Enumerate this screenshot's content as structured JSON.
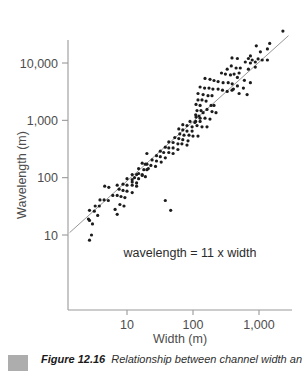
{
  "figure": {
    "caption_label": "Figure 12.16",
    "caption_text": "Relationship between channel width an",
    "bullet_color": "#adadad"
  },
  "colors": {
    "point": "#1c1c1c",
    "trend_line": "#8a8a8a",
    "axis": "#999999",
    "tick_text": "#4d4d4d",
    "annotation_text": "#2b2b2b"
  },
  "chart_data": {
    "type": "scatter",
    "title": "",
    "xlabel": "Width (m)",
    "ylabel": "Wavelength (m)",
    "x_scale": "log",
    "y_scale": "log",
    "xlim": [
      1.3,
      3300
    ],
    "ylim": [
      0.5,
      40000
    ],
    "grid": false,
    "legend": "none",
    "x_ticks": [
      {
        "value": 10,
        "label": "10"
      },
      {
        "value": 100,
        "label": "100"
      },
      {
        "value": 1000,
        "label": "1,000"
      }
    ],
    "y_ticks": [
      {
        "value": 10,
        "label": "10"
      },
      {
        "value": 100,
        "label": "100"
      },
      {
        "value": 1000,
        "label": "1,000"
      },
      {
        "value": 10000,
        "label": "10,000"
      }
    ],
    "annotation": "wavelength = 11 x width",
    "trendline": {
      "equation": "wavelength = 11 x width",
      "x1": 1.35,
      "y1": 11,
      "x2": 2800,
      "y2": 30000
    },
    "points": [
      [
        2300,
        36000
      ],
      [
        1450,
        22000
      ],
      [
        910,
        20000
      ],
      [
        1340,
        17600
      ],
      [
        1050,
        15700
      ],
      [
        740,
        13300
      ],
      [
        390,
        12300
      ],
      [
        470,
        12000
      ],
      [
        690,
        12000
      ],
      [
        790,
        11300
      ],
      [
        970,
        11800
      ],
      [
        1120,
        11300
      ],
      [
        1340,
        11300
      ],
      [
        620,
        10400
      ],
      [
        740,
        10000
      ],
      [
        880,
        10400
      ],
      [
        380,
        8900
      ],
      [
        450,
        8200
      ],
      [
        520,
        8200
      ],
      [
        880,
        8500
      ],
      [
        330,
        7800
      ],
      [
        270,
        6700
      ],
      [
        310,
        6400
      ],
      [
        370,
        6200
      ],
      [
        420,
        6400
      ],
      [
        690,
        7800
      ],
      [
        500,
        6700
      ],
      [
        600,
        5000
      ],
      [
        740,
        4540
      ],
      [
        470,
        5600
      ],
      [
        152,
        5400
      ],
      [
        181,
        5200
      ],
      [
        208,
        4950
      ],
      [
        240,
        4740
      ],
      [
        286,
        4540
      ],
      [
        342,
        4540
      ],
      [
        393,
        4340
      ],
      [
        128,
        3810
      ],
      [
        150,
        3650
      ],
      [
        175,
        3650
      ],
      [
        200,
        3500
      ],
      [
        240,
        3500
      ],
      [
        280,
        3350
      ],
      [
        330,
        3200
      ],
      [
        390,
        3350
      ],
      [
        119,
        2940
      ],
      [
        142,
        2810
      ],
      [
        169,
        2690
      ],
      [
        194,
        2690
      ],
      [
        119,
        2270
      ],
      [
        137,
        2270
      ],
      [
        158,
        2170
      ],
      [
        111,
        1900
      ],
      [
        128,
        1820
      ],
      [
        115,
        1480
      ],
      [
        132,
        1480
      ],
      [
        110,
        1250
      ],
      [
        123,
        1190
      ],
      [
        110,
        960
      ],
      [
        128,
        960
      ],
      [
        470,
        3980
      ],
      [
        580,
        3650
      ],
      [
        410,
        3500
      ],
      [
        500,
        2940
      ],
      [
        660,
        2810
      ],
      [
        188,
        1820
      ],
      [
        208,
        1820
      ],
      [
        163,
        1550
      ],
      [
        142,
        1360
      ],
      [
        194,
        1420
      ],
      [
        223,
        1360
      ],
      [
        111,
        1140
      ],
      [
        128,
        1090
      ],
      [
        152,
        1090
      ],
      [
        181,
        1050
      ],
      [
        90,
        960
      ],
      [
        107,
        920
      ],
      [
        70,
        840
      ],
      [
        81,
        810
      ],
      [
        97,
        770
      ],
      [
        115,
        810
      ],
      [
        137,
        770
      ],
      [
        163,
        770
      ],
      [
        61,
        710
      ],
      [
        70,
        680
      ],
      [
        81,
        650
      ],
      [
        97,
        650
      ],
      [
        63,
        580
      ],
      [
        73,
        550
      ],
      [
        87,
        550
      ],
      [
        100,
        530
      ],
      [
        119,
        530
      ],
      [
        53,
        500
      ],
      [
        61,
        480
      ],
      [
        70,
        460
      ],
      [
        84,
        440
      ],
      [
        43,
        420
      ],
      [
        50,
        410
      ],
      [
        59,
        390
      ],
      [
        68,
        390
      ],
      [
        81,
        370
      ],
      [
        38,
        340
      ],
      [
        43,
        330
      ],
      [
        50,
        330
      ],
      [
        59,
        310
      ],
      [
        32,
        290
      ],
      [
        36,
        275
      ],
      [
        43,
        275
      ],
      [
        50,
        264
      ],
      [
        28,
        242
      ],
      [
        32,
        232
      ],
      [
        38,
        222
      ],
      [
        24,
        204
      ],
      [
        28,
        195
      ],
      [
        33,
        187
      ],
      [
        20,
        172
      ],
      [
        23,
        164
      ],
      [
        27,
        157
      ],
      [
        18,
        138
      ],
      [
        20,
        138
      ],
      [
        15,
        118
      ],
      [
        17,
        113
      ],
      [
        13,
        100
      ],
      [
        15,
        96
      ],
      [
        12,
        84
      ],
      [
        14,
        81
      ],
      [
        20,
        264
      ],
      [
        17,
        179
      ],
      [
        19,
        172
      ],
      [
        15,
        144
      ],
      [
        21,
        144
      ],
      [
        12,
        113
      ],
      [
        14,
        113
      ],
      [
        17,
        109
      ],
      [
        19,
        104
      ],
      [
        10,
        96
      ],
      [
        12,
        92
      ],
      [
        8.7,
        77
      ],
      [
        10,
        74
      ],
      [
        12,
        74
      ],
      [
        14,
        71
      ],
      [
        7.1,
        74
      ],
      [
        4.6,
        71
      ],
      [
        5.3,
        68
      ],
      [
        7.6,
        63
      ],
      [
        8.7,
        60
      ],
      [
        10,
        58
      ],
      [
        12,
        55
      ],
      [
        6.1,
        49
      ],
      [
        7.1,
        49
      ],
      [
        8.1,
        47
      ],
      [
        9.3,
        45
      ],
      [
        3.9,
        41
      ],
      [
        4.5,
        41
      ],
      [
        5.2,
        40
      ],
      [
        3.3,
        32
      ],
      [
        3.8,
        32
      ],
      [
        7.8,
        34
      ],
      [
        9,
        32
      ],
      [
        6.6,
        28
      ],
      [
        2.7,
        27
      ],
      [
        3.2,
        26
      ],
      [
        7.1,
        23
      ],
      [
        3.6,
        22
      ],
      [
        2.6,
        19
      ],
      [
        3,
        15.6
      ],
      [
        2.7,
        18
      ],
      [
        2.9,
        10
      ],
      [
        2.7,
        8.1
      ],
      [
        38,
        40
      ],
      [
        46,
        27
      ]
    ]
  }
}
